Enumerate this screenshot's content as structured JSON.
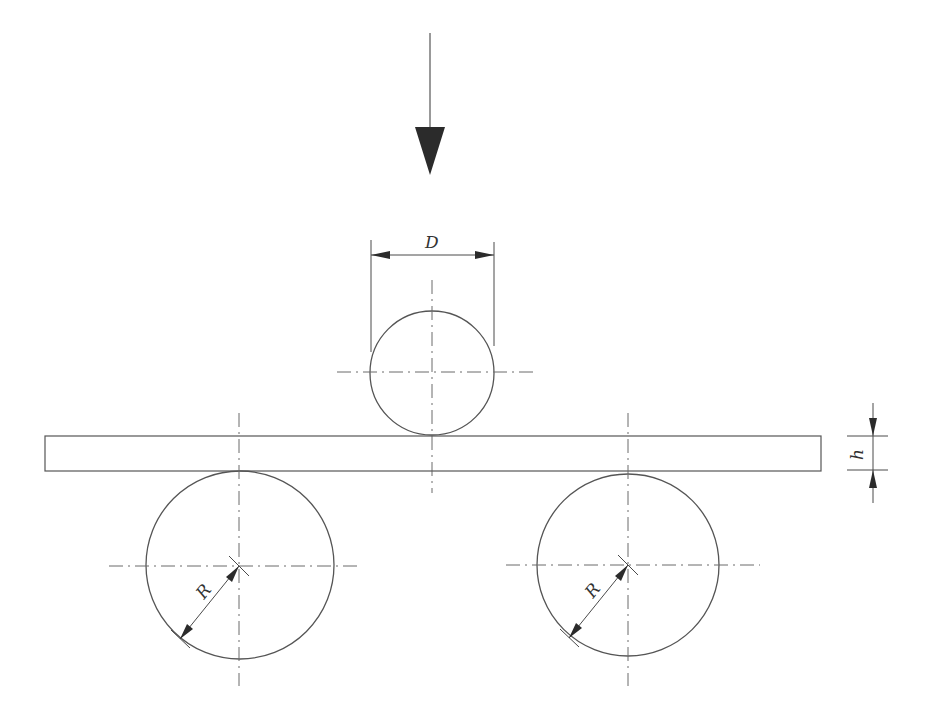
{
  "diagram": {
    "title": "",
    "type": "three-point bending test schematic",
    "labels": {
      "diameter": "D",
      "thickness": "h",
      "radius_left": "R",
      "radius_right": "R"
    },
    "components": [
      {
        "id": "load-arrow",
        "description": "Downward applied load arrow"
      },
      {
        "id": "loading-roller",
        "description": "Upper loading pin of diameter D"
      },
      {
        "id": "specimen-beam",
        "description": "Rectangular specimen of thickness h"
      },
      {
        "id": "left-support",
        "description": "Left support roller of radius R"
      },
      {
        "id": "right-support",
        "description": "Right support roller of radius R"
      }
    ],
    "colors": {
      "line": "#555555",
      "arrow": "#2b2b2b",
      "background": "#ffffff"
    }
  }
}
